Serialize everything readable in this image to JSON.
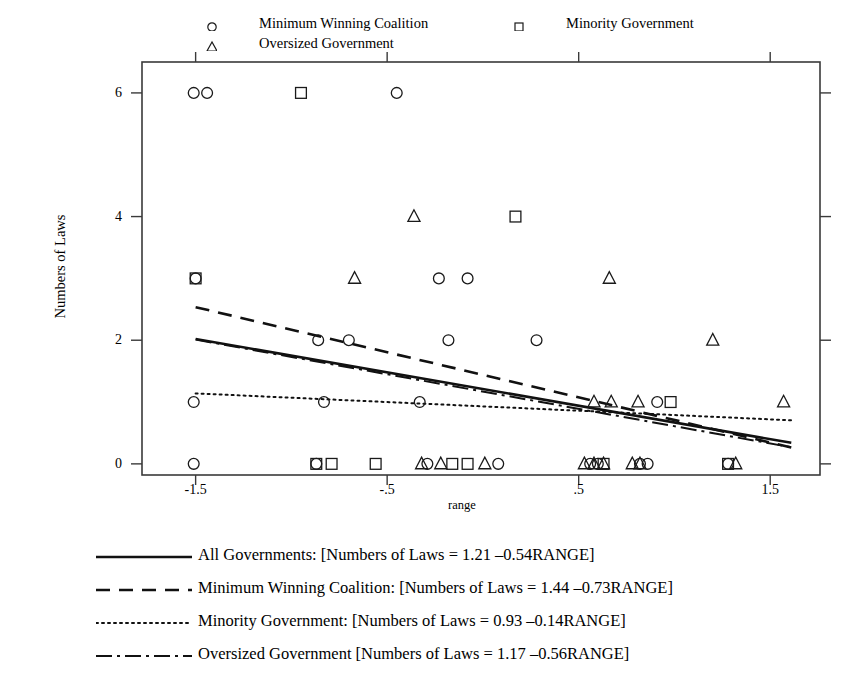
{
  "top_legend": {
    "items": [
      {
        "marker": "circle-marker",
        "label": "Minimum Winning Coalition",
        "x": 205,
        "y": 14
      },
      {
        "marker": "square-marker",
        "label": "Minority Government",
        "x": 512,
        "y": 14
      },
      {
        "marker": "triangle-marker",
        "label": "Oversized Government",
        "x": 205,
        "y": 34
      }
    ]
  },
  "bottom_legend": {
    "items": [
      {
        "style": "solid",
        "label": "All Governments: [Numbers of Laws = 1.21 –0.54RANGE]"
      },
      {
        "style": "dashed",
        "label": "Minimum Winning Coalition: [Numbers of Laws = 1.44 –0.73RANGE]"
      },
      {
        "style": "dotted",
        "label": "Minority Government: [Numbers of Laws = 0.93 –0.14RANGE]"
      },
      {
        "style": "dashdot",
        "label": "Oversized Government [Numbers of Laws = 1.17 –0.56RANGE]"
      }
    ]
  },
  "chart_data": {
    "type": "scatter",
    "title": "",
    "xlabel": "range",
    "ylabel": "Numbers of Laws",
    "xlim": [
      -1.78,
      1.76
    ],
    "ylim": [
      -0.18,
      6.5
    ],
    "xticks": [
      -1.5,
      -0.5,
      0.5,
      1.5
    ],
    "xticklabels": [
      "-1.5",
      "-.5",
      ".5",
      "1.5"
    ],
    "yticks": [
      0,
      2,
      4,
      6
    ],
    "yticklabels": [
      "0",
      "2",
      "4",
      "6"
    ],
    "grid": false,
    "legend_position": "top and bottom (outside axes)",
    "series": [
      {
        "name": "Minimum Winning Coalition",
        "marker": "circle",
        "points": [
          [
            -1.51,
            6
          ],
          [
            -1.44,
            6
          ],
          [
            -0.45,
            6
          ],
          [
            -1.5,
            3
          ],
          [
            -0.23,
            3
          ],
          [
            -0.08,
            3
          ],
          [
            -0.86,
            2
          ],
          [
            -0.7,
            2
          ],
          [
            -0.18,
            2
          ],
          [
            0.28,
            2
          ],
          [
            -1.51,
            1
          ],
          [
            -0.83,
            1
          ],
          [
            -0.33,
            1
          ],
          [
            0.91,
            1
          ],
          [
            -1.51,
            0
          ],
          [
            -0.87,
            0
          ],
          [
            -0.29,
            0
          ],
          [
            0.08,
            0
          ],
          [
            0.56,
            0
          ],
          [
            0.6,
            0
          ],
          [
            0.82,
            0
          ],
          [
            0.86,
            0
          ],
          [
            1.28,
            0
          ]
        ]
      },
      {
        "name": "Minority Government",
        "marker": "square",
        "points": [
          [
            -0.95,
            6
          ],
          [
            0.17,
            4
          ],
          [
            -1.5,
            3
          ],
          [
            -0.87,
            0
          ],
          [
            -0.79,
            0
          ],
          [
            -0.56,
            0
          ],
          [
            -0.16,
            0
          ],
          [
            -0.08,
            0
          ],
          [
            0.63,
            0
          ],
          [
            0.98,
            1
          ],
          [
            1.28,
            0
          ]
        ]
      },
      {
        "name": "Oversized Government",
        "marker": "triangle",
        "points": [
          [
            -0.36,
            4
          ],
          [
            -0.67,
            3
          ],
          [
            0.66,
            3
          ],
          [
            1.2,
            2
          ],
          [
            0.58,
            1
          ],
          [
            0.67,
            1
          ],
          [
            0.81,
            1
          ],
          [
            1.57,
            1
          ],
          [
            -0.32,
            0
          ],
          [
            -0.22,
            0
          ],
          [
            0.01,
            0
          ],
          [
            0.53,
            0
          ],
          [
            0.58,
            0
          ],
          [
            0.63,
            0
          ],
          [
            0.78,
            0
          ],
          [
            0.82,
            0
          ],
          [
            1.32,
            0
          ]
        ]
      }
    ],
    "fit_lines": [
      {
        "name": "All Governments",
        "style": "solid",
        "intercept": 1.21,
        "slope": -0.54,
        "xrange": [
          -1.5,
          1.61
        ]
      },
      {
        "name": "Minimum Winning Coalition",
        "style": "dashed",
        "intercept": 1.44,
        "slope": -0.73,
        "xrange": [
          -1.5,
          1.61
        ]
      },
      {
        "name": "Minority Government",
        "style": "dotted",
        "intercept": 0.93,
        "slope": -0.14,
        "xrange": [
          -1.5,
          1.61
        ]
      },
      {
        "name": "Oversized Government",
        "style": "dashdot",
        "intercept": 1.17,
        "slope": -0.56,
        "xrange": [
          -1.5,
          1.61
        ]
      }
    ]
  }
}
